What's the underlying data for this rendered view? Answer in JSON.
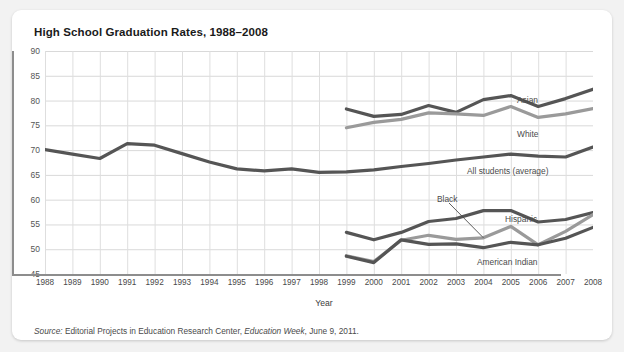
{
  "card": {
    "title": "High School Graduation Rates, 1988–2008",
    "source_prefix": "Source:",
    "source_text": " Editorial Projects in Education Research Center, ",
    "source_italic": "Education Week",
    "source_suffix": ", June 9, 2011."
  },
  "labels": {
    "asian": "Asian",
    "white": "White",
    "all_students": "All students (average)",
    "black": "Black",
    "hispanic": "Hispanic",
    "american_indian": "American Indian"
  },
  "chart_data": {
    "type": "line",
    "title": "High School Graduation Rates, 1988–2008",
    "xlabel": "Year",
    "ylabel": "",
    "xlim": [
      1988,
      2008
    ],
    "ylim": [
      45,
      90
    ],
    "ytick_step": 5,
    "grid": true,
    "legend": "inline-end-labels",
    "yticks": [
      45,
      50,
      55,
      60,
      65,
      70,
      75,
      80,
      85,
      90
    ],
    "categories": [
      1988,
      1989,
      1990,
      1991,
      1992,
      1993,
      1994,
      1995,
      1996,
      1997,
      1998,
      1999,
      2000,
      2001,
      2002,
      2003,
      2004,
      2005,
      2006,
      2007,
      2008
    ],
    "series": [
      {
        "name": "All students (average)",
        "color": "#555555",
        "x": [
          1988,
          1989,
          1990,
          1991,
          1992,
          1993,
          1994,
          1995,
          1996,
          1997,
          1998,
          1999,
          2000,
          2001,
          2002,
          2003,
          2004,
          2005,
          2006,
          2007,
          2008
        ],
        "values": [
          70.1,
          69.2,
          68.3,
          71.3,
          71.0,
          69.3,
          67.6,
          66.2,
          65.8,
          66.2,
          65.5,
          65.6,
          66.0,
          66.7,
          67.3,
          68.0,
          68.6,
          69.2,
          68.8,
          68.6,
          70.6
        ]
      },
      {
        "name": "Asian",
        "color": "#555555",
        "x": [
          1999,
          2000,
          2001,
          2002,
          2003,
          2004,
          2005,
          2006,
          2007,
          2008
        ],
        "values": [
          78.3,
          76.8,
          77.2,
          79.0,
          77.6,
          80.2,
          81.0,
          78.8,
          80.4,
          82.3
        ]
      },
      {
        "name": "White",
        "color": "#9a9a9a",
        "x": [
          1999,
          2000,
          2001,
          2002,
          2003,
          2004,
          2005,
          2006,
          2007,
          2008
        ],
        "values": [
          74.5,
          75.6,
          76.2,
          77.5,
          77.3,
          77.0,
          78.8,
          76.6,
          77.3,
          78.4
        ]
      },
      {
        "name": "Hispanic",
        "color": "#555555",
        "x": [
          1999,
          2000,
          2001,
          2002,
          2003,
          2004,
          2005,
          2006,
          2007,
          2008
        ],
        "values": [
          53.4,
          51.9,
          53.4,
          55.6,
          56.2,
          57.8,
          57.8,
          55.5,
          56.0,
          57.4
        ]
      },
      {
        "name": "Black",
        "color": "#9a9a9a",
        "x": [
          1999,
          2000,
          2001,
          2002,
          2003,
          2004,
          2005,
          2006,
          2007,
          2008
        ],
        "values": [
          48.7,
          47.5,
          51.8,
          52.8,
          52.0,
          52.3,
          54.6,
          50.9,
          53.6,
          57.0
        ]
      },
      {
        "name": "American Indian",
        "color": "#555555",
        "x": [
          1999,
          2000,
          2001,
          2002,
          2003,
          2004,
          2005,
          2006,
          2007,
          2008
        ],
        "values": [
          48.6,
          47.3,
          51.9,
          51.0,
          51.1,
          50.3,
          51.4,
          50.9,
          52.2,
          54.4
        ]
      }
    ]
  }
}
